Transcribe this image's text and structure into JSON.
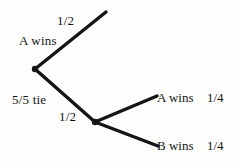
{
  "diagram": {
    "type": "probability-tree",
    "title": "",
    "background_color": "#fdfdfc",
    "line_color": "#151515",
    "nodes": [
      {
        "id": "root",
        "label": "5/5 tie",
        "x": 35,
        "y": 69
      },
      {
        "id": "split2",
        "label": "",
        "x": 95,
        "y": 122
      }
    ],
    "branches": [
      {
        "id": "branch-top",
        "from": "root",
        "to_x": 106,
        "to_y": 12,
        "probability": "1/2",
        "outcome": "A wins"
      },
      {
        "id": "branch-down",
        "from": "root",
        "to_x": 95,
        "to_y": 122,
        "probability": "1/2",
        "outcome": ""
      },
      {
        "id": "branch-upper-right",
        "from": "split2",
        "to_x": 157,
        "to_y": 96,
        "probability": "1/4",
        "outcome": "A wins"
      },
      {
        "id": "branch-lower-right",
        "from": "split2",
        "to_x": 158,
        "to_y": 146,
        "probability": "1/4",
        "outcome": "B wins"
      }
    ],
    "labels": {
      "top_probability": "1/2",
      "top_outcome": "A wins",
      "root_label": "5/5 tie",
      "second_probability": "1/2",
      "upper_right_outcome": "A wins",
      "upper_right_probability": "1/4",
      "lower_right_outcome": "B wins",
      "lower_right_probability": "1/4"
    }
  }
}
